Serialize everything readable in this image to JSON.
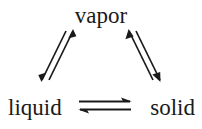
{
  "diagram": {
    "background_color": "#ffffff",
    "ink_color": "#1a1a1a",
    "nodes": {
      "top": "vapor",
      "bottom_left": "liquid",
      "bottom_right": "solid"
    },
    "edges": [
      {
        "name": "liquid-vapor",
        "from": "liquid",
        "to": "vapor",
        "style": "double-arrow-pair",
        "orientation": "diagonal-up-right"
      },
      {
        "name": "vapor-solid",
        "from": "vapor",
        "to": "solid",
        "style": "double-arrow-pair",
        "orientation": "diagonal-down-right"
      },
      {
        "name": "liquid-solid",
        "from": "liquid",
        "to": "solid",
        "style": "equilibrium-harpoons",
        "orientation": "horizontal"
      }
    ]
  }
}
